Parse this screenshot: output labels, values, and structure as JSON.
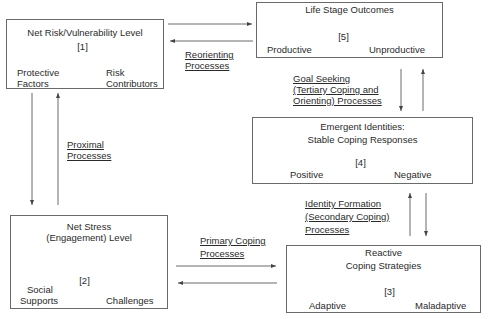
{
  "diagram": {
    "type": "flow-model",
    "colors": {
      "box_border": "#6a6a6a",
      "text": "#2a2a2a",
      "arrow": "#444444",
      "dark_arrow": "#3a3a3a",
      "light_arrow": "#e4e4e4"
    },
    "boxes": {
      "net_risk": {
        "title": "Net Risk/Vulnerability Level",
        "number": "[1]",
        "left_line1": "Protective",
        "left_line2": "Factors",
        "right_line1": "Risk",
        "right_line2": "Contributors"
      },
      "life_stage": {
        "title": "Life Stage Outcomes",
        "number": "[5]",
        "left": "Productive",
        "right": "Unproductive"
      },
      "emergent": {
        "title_line1": "Emergent Identities:",
        "title_line2": "Stable Coping Responses",
        "number": "[4]",
        "left": "Positive",
        "right": "Negative"
      },
      "net_stress": {
        "title_line1": "Net Stress",
        "title_line2": "(Engagement) Level",
        "number": "[2]",
        "left_line1": "Social",
        "left_line2": "Supports",
        "right": "Challenges"
      },
      "reactive": {
        "title_line1": "Reactive",
        "title_line2": "Coping Strategies",
        "number": "[3]",
        "left": "Adaptive",
        "right": "Maladaptive"
      }
    },
    "process_labels": {
      "reorienting": {
        "line1": "Reorienting",
        "line2": "Processes"
      },
      "goal_seeking": {
        "line1": "Goal Seeking",
        "line2": "(Tertiary Coping and",
        "line3": "Orienting) Processes"
      },
      "proximal": {
        "line1": "Proximal",
        "line2": "Processes"
      },
      "identity_formation": {
        "line1": "Identity Formation",
        "line2": "(Secondary Coping)",
        "line3": "Processes"
      },
      "primary_coping": {
        "line1": "Primary Coping",
        "line2": "Processes"
      }
    }
  }
}
